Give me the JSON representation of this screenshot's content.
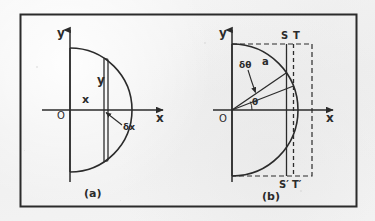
{
  "figure": {
    "background_color": "#f1f1f1",
    "ink_color": "#2b2b2b",
    "panels": [
      {
        "id": "a",
        "caption": "(a)",
        "description": "Semicircle with vertical rectangular strip element of width delta-x",
        "axis_labels": {
          "y_axis": "y",
          "x_axis": "x",
          "origin": "O"
        },
        "annotations": [
          {
            "name": "strip-height-label",
            "text": "y"
          },
          {
            "name": "strip-abscissa-label",
            "text": "x"
          },
          {
            "name": "strip-width-label",
            "text": "δx"
          }
        ]
      },
      {
        "id": "b",
        "caption": "(b)",
        "description": "Semicircle with radial element subtending angle delta-theta, bounded by strips SS-prime and TT-prime",
        "axis_labels": {
          "y_axis": "y",
          "x_axis": "x",
          "origin": "O"
        },
        "annotations": [
          {
            "name": "angle-increment-label",
            "text": "δθ"
          },
          {
            "name": "radius-label",
            "text": "a"
          },
          {
            "name": "angle-label",
            "text": "θ"
          },
          {
            "name": "point-s-label",
            "text": "S"
          },
          {
            "name": "point-t-label",
            "text": "T"
          },
          {
            "name": "point-s-prime-label",
            "text": "S′"
          },
          {
            "name": "point-t-prime-label",
            "text": "T′"
          }
        ]
      }
    ]
  }
}
